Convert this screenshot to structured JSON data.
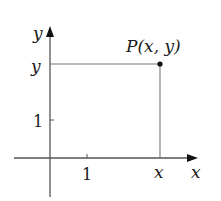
{
  "diagram": {
    "type": "cartesian-point",
    "axes": {
      "x_label": "x",
      "y_label": "y"
    },
    "ticks": {
      "x_tick_label": "1",
      "y_tick_label": "1"
    },
    "point": {
      "label": "P(x, y)",
      "x_coord_label": "x",
      "y_coord_label": "y"
    },
    "colors": {
      "axis": "#555555",
      "guide": "#777777",
      "point": "#111111",
      "text": "#1a1a1a"
    }
  }
}
